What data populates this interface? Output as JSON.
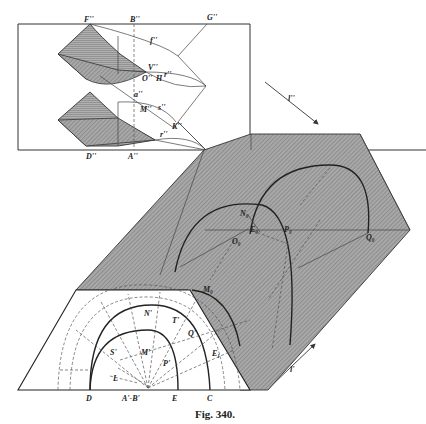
{
  "figure": {
    "caption": "Fig. 340.",
    "colors": {
      "shade": "#9a9a9a",
      "shade_dark": "#7d7d7d",
      "ink": "#222222",
      "paper": "#ffffff"
    }
  },
  "elevation_view": {
    "labels": {
      "F": "F''",
      "B": "B''",
      "G": "G''",
      "f": "f''",
      "V": "V''",
      "O": "O''",
      "H": "H",
      "r1": "r''",
      "a": "a''",
      "M": "M''",
      "s": "s''",
      "K": "K''",
      "r2": "r''",
      "D": "D''",
      "A": "A''",
      "C": "C''"
    }
  },
  "light_arrows": {
    "upper": "l''",
    "lower": "l'"
  },
  "plan_view": {
    "labels": {
      "N0": "N₀",
      "E0": "E₀",
      "O0": "O₀",
      "P0": "P₀",
      "Q0": "Q₀",
      "M0": "M₀",
      "N": "N'",
      "T": "T'",
      "Q": "Q'",
      "S": "S'",
      "M": "M'",
      "P": "P'",
      "E1": "E₁",
      "L": "L",
      "AB": "A'-B'",
      "D": "D",
      "E": "E",
      "C": "C"
    }
  }
}
